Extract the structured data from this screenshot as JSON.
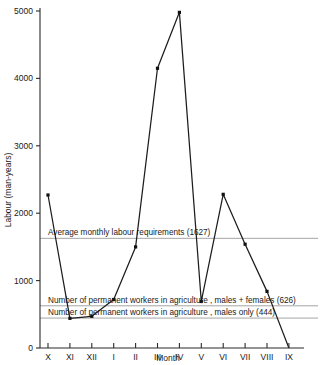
{
  "chart_data": {
    "type": "line",
    "title": "",
    "xlabel": "Month",
    "ylabel": "Labour (man-years)",
    "categories": [
      "X",
      "XI",
      "XII",
      "I",
      "II",
      "III",
      "IV",
      "V",
      "VI",
      "VII",
      "VIII",
      "IX"
    ],
    "values": [
      2270,
      440,
      470,
      720,
      1500,
      4150,
      4980,
      690,
      2280,
      1540,
      840,
      0
    ],
    "series": [
      {
        "name": "Monthly labour requirements",
        "values": [
          2270,
          440,
          470,
          720,
          1500,
          4150,
          4980,
          690,
          2280,
          1540,
          840,
          0
        ]
      }
    ],
    "ylim": [
      0,
      5000
    ],
    "y_ticks": [
      0,
      1000,
      2000,
      3000,
      4000,
      5000
    ],
    "y_tick_labels": [
      "0",
      "1000",
      "2000",
      "3000",
      "4000",
      "5000"
    ],
    "grid": false,
    "legend": "none",
    "marker": "square",
    "reference_lines": [
      {
        "id": "average-requirement",
        "value": 1627,
        "label": "Average monthly labour requirements (1627)"
      },
      {
        "id": "permanent-males-females",
        "value": 626,
        "label": "Number of permanent workers in agriculture , males + females (626)"
      },
      {
        "id": "permanent-males-only",
        "value": 444,
        "label": "Number of permanent workers in agriculture , males only (444)"
      }
    ]
  }
}
